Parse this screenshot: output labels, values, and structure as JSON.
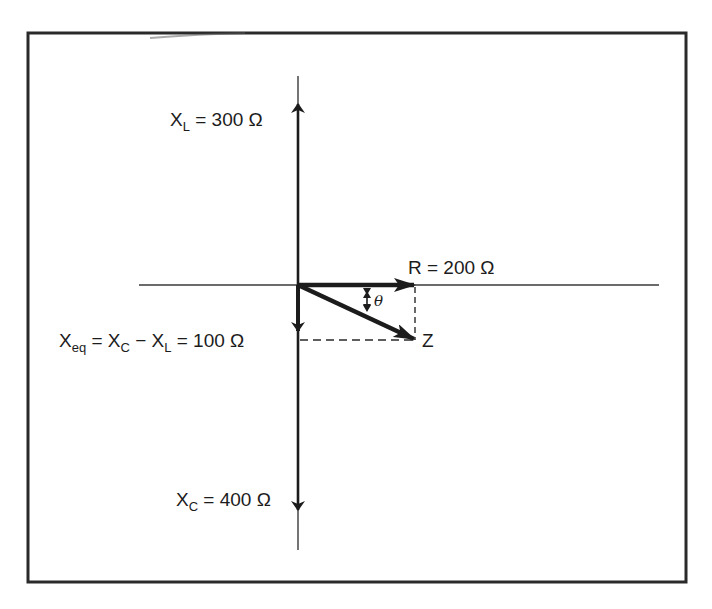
{
  "diagram": {
    "type": "impedance phasor diagram",
    "frame": {
      "left": 28,
      "top": 33,
      "right": 686,
      "bottom": 582,
      "stroke": "#2a2a2a"
    },
    "origin": {
      "x": 298,
      "y": 285
    },
    "axes": {
      "horizontal": {
        "x1": 139,
        "x2": 659,
        "y": 285
      },
      "vertical": {
        "x": 298,
        "y1": 76,
        "y2": 550
      }
    },
    "labels": {
      "xl": {
        "var": "X",
        "sub": "L",
        "rest": " = 300 Ω"
      },
      "r": {
        "text": "R = 200 Ω"
      },
      "xeq": {
        "var": "X",
        "sub": "eq",
        "mid1": " = X",
        "sub2": "C",
        "mid2": " − X",
        "sub3": "L",
        "rest": " = 100 Ω"
      },
      "z": {
        "text": "Z"
      },
      "xc": {
        "var": "X",
        "sub": "C",
        "rest": " = 400 Ω"
      },
      "theta": {
        "text": "θ"
      }
    },
    "components": [
      {
        "name": "X_L",
        "value": 300,
        "unit": "Ω",
        "direction": "up"
      },
      {
        "name": "R",
        "value": 200,
        "unit": "Ω",
        "direction": "right"
      },
      {
        "name": "X_C",
        "value": 400,
        "unit": "Ω",
        "direction": "down"
      },
      {
        "name": "X_eq",
        "formula": "X_C − X_L",
        "value": 100,
        "unit": "Ω",
        "direction": "down"
      },
      {
        "name": "Z",
        "description": "resultant impedance vector"
      },
      {
        "name": "θ",
        "description": "phase angle between R and Z"
      }
    ],
    "colors": {
      "ink": "#1c1c1c",
      "thin_line": "#3a3a3a",
      "background": "#ffffff"
    }
  }
}
